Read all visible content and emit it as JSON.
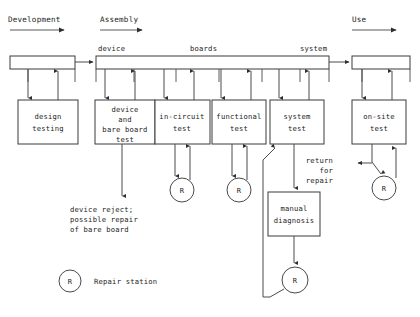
{
  "diagram": {
    "colors": {
      "background": "#ffffff",
      "line": "#4a4a4a",
      "box_stroke": "#3a3a3a",
      "text": "#1c1c1c"
    },
    "phases": [
      {
        "label": "Development",
        "x": 8,
        "y": 22,
        "rule_x1": 10,
        "rule_x2": 68,
        "rule_y": 30
      },
      {
        "label": "Assembly",
        "x": 100,
        "y": 22,
        "rule_x1": 100,
        "rule_x2": 146,
        "rule_y": 30
      },
      {
        "label": "Use",
        "x": 352,
        "y": 22,
        "rule_x1": 352,
        "rule_x2": 400,
        "rule_y": 30
      }
    ],
    "bars": [
      {
        "name": "development-bar",
        "x": 10,
        "y": 56,
        "w": 65,
        "h": 13,
        "ticks": []
      },
      {
        "name": "assembly-bar",
        "x": 96,
        "y": 56,
        "w": 233,
        "h": 13,
        "ticks": [
          134,
          176,
          219,
          262,
          300
        ]
      },
      {
        "name": "use-bar",
        "x": 352,
        "y": 56,
        "w": 58,
        "h": 13,
        "ticks": []
      }
    ],
    "bar_labels": [
      {
        "text": "device",
        "x": 98,
        "y": 51
      },
      {
        "text": "boards",
        "x": 190,
        "y": 51
      },
      {
        "text": "system",
        "x": 300,
        "y": 51
      }
    ],
    "boxes": [
      {
        "name": "design-testing-box",
        "x": 18,
        "y": 100,
        "w": 60,
        "h": 44,
        "lines": [
          "design",
          "testing"
        ]
      },
      {
        "name": "device-bare-board-box",
        "x": 95,
        "y": 100,
        "w": 60,
        "h": 44,
        "lines": [
          "device",
          "and",
          "bare board",
          "test"
        ]
      },
      {
        "name": "in-circuit-test-box",
        "x": 155,
        "y": 100,
        "w": 55,
        "h": 44,
        "lines": [
          "in-circuit",
          "test"
        ]
      },
      {
        "name": "functional-test-box",
        "x": 212,
        "y": 100,
        "w": 54,
        "h": 44,
        "lines": [
          "functional",
          "test"
        ]
      },
      {
        "name": "system-test-box",
        "x": 270,
        "y": 100,
        "w": 54,
        "h": 44,
        "lines": [
          "system",
          "test"
        ]
      },
      {
        "name": "on-site-test-box",
        "x": 352,
        "y": 100,
        "w": 54,
        "h": 44,
        "lines": [
          "on-site",
          "test"
        ]
      },
      {
        "name": "manual-diagnosis-box",
        "x": 268,
        "y": 192,
        "w": 52,
        "h": 44,
        "lines": [
          "manual",
          "diagnosis"
        ]
      }
    ],
    "repair_nodes": [
      {
        "name": "repair-node-in-circuit",
        "cx": 182,
        "cy": 190,
        "r": 12,
        "label": "R"
      },
      {
        "name": "repair-node-functional",
        "cx": 239,
        "cy": 190,
        "r": 12,
        "label": "R"
      },
      {
        "name": "repair-node-on-site",
        "cx": 384,
        "cy": 188,
        "r": 12,
        "label": "R"
      },
      {
        "name": "repair-node-system",
        "cx": 295,
        "cy": 280,
        "r": 13,
        "label": "R"
      }
    ],
    "notes": [
      {
        "name": "device-reject-note",
        "x": 70,
        "y": 212,
        "lines": [
          "device reject;",
          "possible repair",
          "of bare board"
        ]
      },
      {
        "name": "return-for-repair-note",
        "x": 333,
        "y": 163,
        "lines": [
          "return",
          "for",
          "repair"
        ]
      }
    ],
    "legend": {
      "name": "legend-repair-station",
      "circle": {
        "cx": 70,
        "cy": 281,
        "r": 11,
        "label": "R"
      },
      "text": "Repair station",
      "text_x": 94,
      "text_y": 284
    }
  }
}
